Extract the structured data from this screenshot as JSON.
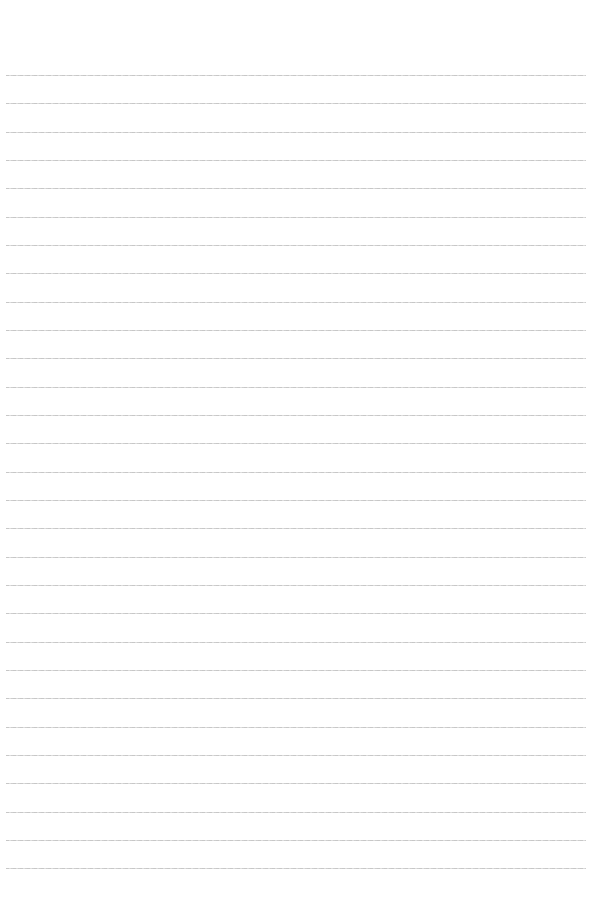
{
  "page": {
    "type": "lined-paper",
    "background_color": "#ffffff",
    "rule_color": "#c4c4c4",
    "rule_count": 29,
    "first_rule_y": 75,
    "rule_spacing": 28.33,
    "rule_left": 6,
    "rule_right": 586
  }
}
